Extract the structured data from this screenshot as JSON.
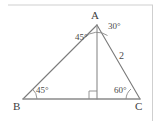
{
  "figure": {
    "kind": "geometry-diagram",
    "shape": "triangle-with-altitude",
    "stroke_color": "#7a7a7a",
    "border_color": "#cfcfcf",
    "background": "#ffffff",
    "vertices": {
      "A": "A",
      "B": "B",
      "C": "C"
    },
    "angles": {
      "at_A_left": "45°",
      "at_A_right": "30°",
      "at_B": "45°",
      "at_C": "60°",
      "at_foot": "right-angle-mark"
    },
    "sides": {
      "AC_length": "2"
    }
  }
}
